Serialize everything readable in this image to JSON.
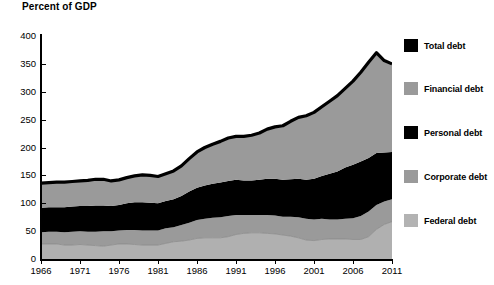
{
  "chart_data": {
    "type": "area",
    "stacked": true,
    "title": "Percent of GDP",
    "xlabel": "",
    "ylabel": "Percent of GDP",
    "xlim": [
      1966,
      2011
    ],
    "ylim": [
      0,
      400
    ],
    "y_ticks": [
      0,
      50,
      100,
      150,
      200,
      250,
      300,
      350,
      400
    ],
    "x_ticks": [
      1966,
      1971,
      1976,
      1981,
      1986,
      1991,
      1996,
      2001,
      2006,
      2011
    ],
    "grid": false,
    "legend_position": "right",
    "total_line_label": "Total debt",
    "x": [
      1966,
      1967,
      1968,
      1969,
      1970,
      1971,
      1972,
      1973,
      1974,
      1975,
      1976,
      1977,
      1978,
      1979,
      1980,
      1981,
      1982,
      1983,
      1984,
      1985,
      1986,
      1987,
      1988,
      1989,
      1990,
      1991,
      1992,
      1993,
      1994,
      1995,
      1996,
      1997,
      1998,
      1999,
      2000,
      2001,
      2002,
      2003,
      2004,
      2005,
      2006,
      2007,
      2008,
      2009,
      2010,
      2011
    ],
    "series": [
      {
        "name": "Federal debt",
        "color": "#b0b0b0",
        "values": [
          27,
          27,
          27,
          25,
          25,
          26,
          25,
          24,
          23,
          25,
          27,
          27,
          26,
          25,
          25,
          25,
          28,
          31,
          32,
          34,
          37,
          38,
          38,
          38,
          40,
          44,
          46,
          47,
          47,
          46,
          45,
          43,
          41,
          38,
          34,
          33,
          35,
          36,
          36,
          36,
          35,
          35,
          40,
          53,
          62,
          67
        ]
      },
      {
        "name": "Corporate debt",
        "color": "#9a9a9a",
        "values": [
          21,
          22,
          22,
          23,
          24,
          24,
          24,
          25,
          27,
          25,
          24,
          25,
          26,
          26,
          26,
          26,
          27,
          26,
          29,
          31,
          33,
          34,
          36,
          37,
          37,
          35,
          33,
          32,
          32,
          33,
          33,
          33,
          35,
          37,
          38,
          38,
          37,
          35,
          35,
          36,
          38,
          42,
          45,
          44,
          41,
          40
        ]
      },
      {
        "name": "Personal debt",
        "color": "#000000",
        "values": [
          44,
          44,
          44,
          45,
          45,
          45,
          46,
          47,
          46,
          45,
          46,
          48,
          50,
          51,
          50,
          49,
          49,
          50,
          52,
          56,
          58,
          60,
          61,
          62,
          63,
          63,
          62,
          62,
          63,
          65,
          66,
          66,
          67,
          69,
          70,
          73,
          77,
          82,
          86,
          92,
          96,
          98,
          96,
          93,
          88,
          85
        ]
      },
      {
        "name": "Financial debt",
        "color": "#9a9a9a",
        "values": [
          44,
          44,
          45,
          45,
          45,
          45,
          46,
          47,
          47,
          45,
          45,
          46,
          47,
          49,
          49,
          48,
          49,
          51,
          54,
          59,
          64,
          68,
          71,
          74,
          77,
          78,
          79,
          81,
          84,
          89,
          93,
          97,
          104,
          110,
          115,
          119,
          124,
          130,
          136,
          142,
          150,
          160,
          172,
          180,
          165,
          158
        ]
      }
    ],
    "total": [
      136,
      137,
      138,
      138,
      139,
      140,
      141,
      143,
      143,
      140,
      142,
      146,
      149,
      151,
      150,
      148,
      153,
      158,
      167,
      180,
      192,
      200,
      206,
      211,
      217,
      220,
      220,
      222,
      226,
      233,
      237,
      239,
      247,
      254,
      257,
      263,
      273,
      283,
      293,
      306,
      319,
      335,
      353,
      370,
      356,
      350
    ]
  },
  "legend": {
    "items": [
      {
        "label": "Total debt",
        "color": "#000000"
      },
      {
        "label": "Financial debt",
        "color": "#9a9a9a"
      },
      {
        "label": "Personal debt",
        "color": "#000000"
      },
      {
        "label": "Corporate debt",
        "color": "#9a9a9a"
      },
      {
        "label": "Federal debt",
        "color": "#b3b3b3"
      }
    ]
  },
  "axes": {
    "y_labels": [
      "400",
      "350",
      "300",
      "250",
      "200",
      "150",
      "100",
      "50",
      "0"
    ],
    "x_labels": [
      "1966",
      "1971",
      "1976",
      "1981",
      "1986",
      "1991",
      "1996",
      "2001",
      "2006",
      "2011"
    ]
  }
}
